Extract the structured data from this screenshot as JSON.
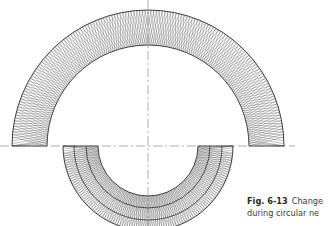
{
  "figure": {
    "center": {
      "x": 148,
      "y": 146
    },
    "upper_ring": {
      "outer_r": 136,
      "inner_r": 101,
      "strands": 150
    },
    "lower_ring": {
      "outer_r": 85,
      "inner_r": 50,
      "dividers": [
        62,
        74
      ],
      "strands": 110
    },
    "axis_horizontal": {
      "x1": 0,
      "x2": 295
    },
    "axis_vertical": {
      "y1": 0,
      "y2": 226
    },
    "line_color": "#2b2b2b",
    "axis_color": "#777777"
  },
  "caption": {
    "label": "Fig. 6-13",
    "line1": "Change",
    "line2": "during circular ne"
  }
}
